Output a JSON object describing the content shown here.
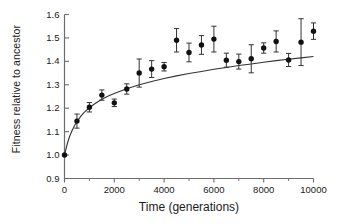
{
  "chart_data": {
    "type": "scatter",
    "title": "",
    "xlabel": "Time (generations)",
    "ylabel": "Fitness relative to ancestor",
    "xlim": [
      0,
      10000
    ],
    "ylim": [
      0.9,
      1.6
    ],
    "xticks": [
      0,
      2000,
      4000,
      6000,
      8000,
      10000
    ],
    "xtick_labels": [
      "0",
      "2000",
      "4000",
      "6000",
      "8000",
      "10000"
    ],
    "xminor_ticks": [
      1000,
      3000,
      5000,
      7000,
      9000
    ],
    "yticks": [
      0.9,
      1.0,
      1.1,
      1.2,
      1.3,
      1.4,
      1.5,
      1.6
    ],
    "ytick_labels": [
      "0.9",
      "1.0",
      "1.1",
      "1.2",
      "1.3",
      "1.4",
      "1.5",
      "1.6"
    ],
    "grid": false,
    "legend": null,
    "marker": "filled-circle",
    "marker_color": "#111111",
    "line_color": "#333333",
    "errorbar_color": "#333333",
    "spines": [
      "left",
      "bottom"
    ],
    "x": [
      0,
      500,
      1000,
      1500,
      2000,
      2500,
      3000,
      3500,
      4000,
      4500,
      5000,
      5500,
      6000,
      6500,
      7000,
      7500,
      8000,
      8500,
      9000,
      9500,
      10000
    ],
    "values": [
      1.0,
      1.145,
      1.204,
      1.256,
      1.223,
      1.282,
      1.35,
      1.367,
      1.377,
      1.49,
      1.438,
      1.47,
      1.495,
      1.405,
      1.399,
      1.411,
      1.457,
      1.485,
      1.406,
      1.482,
      1.529
    ],
    "yerr": [
      0.0,
      0.03,
      0.02,
      0.022,
      0.016,
      0.022,
      0.06,
      0.036,
      0.018,
      0.05,
      0.04,
      0.04,
      0.055,
      0.03,
      0.032,
      0.06,
      0.022,
      0.045,
      0.028,
      0.1,
      0.035
    ],
    "fit_curve": {
      "description": "hyperbolic fit of fitness vs generations",
      "x": [
        0,
        100,
        200,
        300,
        400,
        500,
        650,
        800,
        1000,
        1200,
        1500,
        1800,
        2100,
        2500,
        3000,
        3500,
        4000,
        4500,
        5000,
        5500,
        6000,
        6500,
        7000,
        7500,
        8000,
        8500,
        9000,
        9500,
        10000
      ],
      "y": [
        1.0,
        1.044,
        1.078,
        1.104,
        1.125,
        1.143,
        1.165,
        1.183,
        1.202,
        1.218,
        1.238,
        1.254,
        1.267,
        1.283,
        1.3,
        1.314,
        1.327,
        1.338,
        1.348,
        1.357,
        1.366,
        1.374,
        1.382,
        1.389,
        1.396,
        1.403,
        1.409,
        1.415,
        1.421
      ]
    }
  }
}
